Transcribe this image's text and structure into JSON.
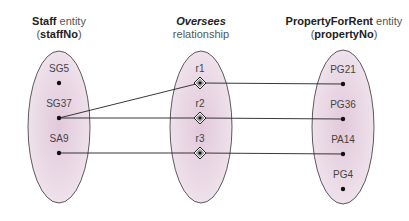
{
  "headers": {
    "staff": {
      "name": "Staff",
      "suffix": " entity",
      "key_open": "(",
      "key": "staffNo",
      "key_close": ")"
    },
    "oversees": {
      "name": "Oversees",
      "suffix": "relationship"
    },
    "property": {
      "name": "PropertyForRent",
      "suffix": " entity",
      "key_open": "(",
      "key": "propertyNo",
      "key_close": ")"
    }
  },
  "staff_entities": [
    {
      "label": "SG5"
    },
    {
      "label": "SG37"
    },
    {
      "label": "SA9"
    }
  ],
  "relationships": [
    {
      "label": "r1"
    },
    {
      "label": "r2"
    },
    {
      "label": "r3"
    }
  ],
  "property_entities": [
    {
      "label": "PG21"
    },
    {
      "label": "PG36"
    },
    {
      "label": "PA14"
    },
    {
      "label": "PG4"
    }
  ],
  "links": [
    {
      "from": "SG37",
      "rel": "r1",
      "to": "PG21"
    },
    {
      "from": "SG37",
      "rel": "r2",
      "to": "PG36"
    },
    {
      "from": "SA9",
      "rel": "r3",
      "to": "PA14"
    }
  ],
  "colors": {
    "ellipse_fill": "#e9d8e4",
    "ellipse_stroke": "#333333",
    "line": "#222222"
  }
}
